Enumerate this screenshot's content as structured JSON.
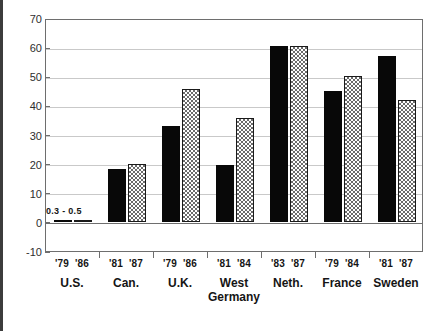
{
  "chart_data": {
    "type": "bar",
    "title": "",
    "xlabel": "",
    "ylabel": "",
    "ylim": [
      -10,
      70
    ],
    "yticks": [
      70,
      60,
      50,
      40,
      30,
      20,
      10,
      0,
      -10
    ],
    "ytick_labels": [
      "70",
      "60",
      "50",
      "40",
      "30",
      "20",
      "10",
      "0",
      "-10"
    ],
    "grid": true,
    "legend_position": "none",
    "categories": [
      "U.S.",
      "Can.",
      "U.K.",
      "West Germany",
      "Neth.",
      "France",
      "Sweden"
    ],
    "category_labels": [
      {
        "line1": "U.S.",
        "line2": ""
      },
      {
        "line1": "Can.",
        "line2": ""
      },
      {
        "line1": "U.K.",
        "line2": ""
      },
      {
        "line1": "West",
        "line2": "Germany"
      },
      {
        "line1": "Neth.",
        "line2": ""
      },
      {
        "line1": "France",
        "line2": ""
      },
      {
        "line1": "Sweden",
        "line2": ""
      }
    ],
    "series": [
      {
        "name": "earlier year",
        "style": "solid-black",
        "year_labels": [
          "'79",
          "'81",
          "'79",
          "'81",
          "'83",
          "'79",
          "'81"
        ],
        "values": [
          0.3,
          18,
          33,
          19.5,
          60.5,
          45,
          57
        ]
      },
      {
        "name": "later year",
        "style": "hatched",
        "year_labels": [
          "'86",
          "'87",
          "'86",
          "'84",
          "'87",
          "'84",
          "'87"
        ],
        "values": [
          0.5,
          20,
          45.5,
          35.5,
          60.5,
          50,
          42
        ]
      }
    ],
    "annotations": [
      {
        "text": "0.3 - 0.5",
        "group": "U.S.",
        "value_range": [
          0.3,
          0.5
        ]
      }
    ]
  }
}
